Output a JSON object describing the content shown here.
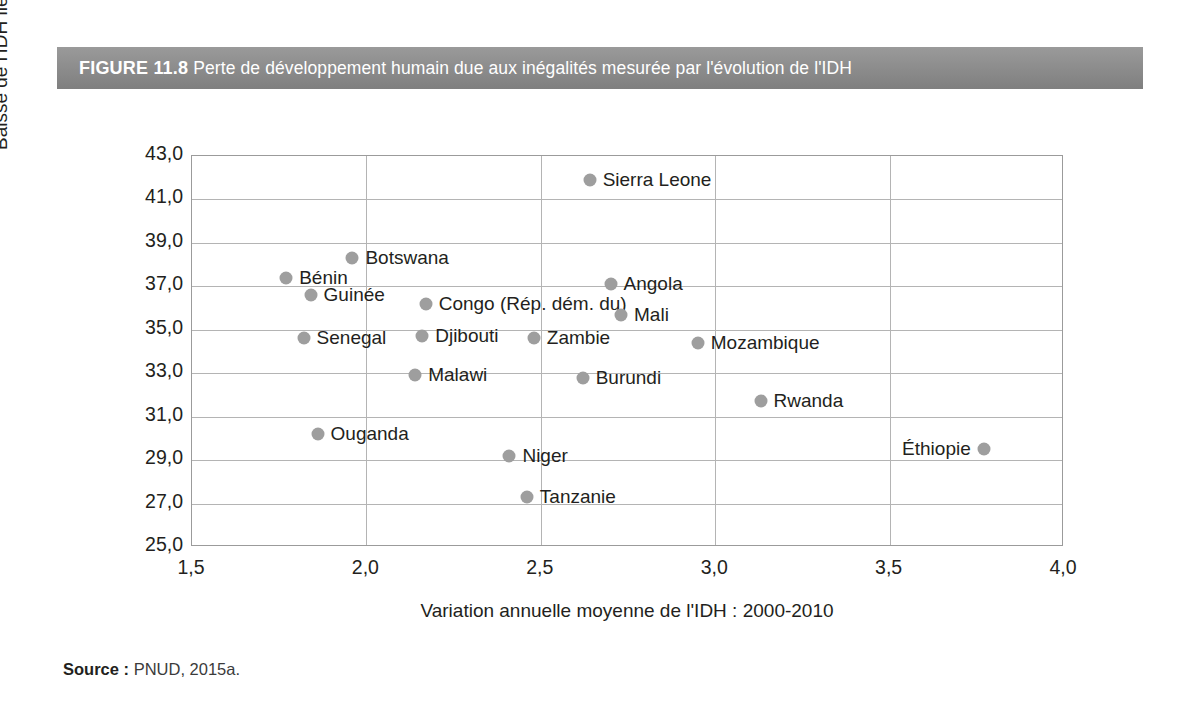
{
  "figure": {
    "number": "FIGURE 11.8",
    "title": "Perte de développement humain due aux inégalités mesurée par l'évolution de l'IDH",
    "header_bg": "#8e8e8e",
    "header_text_color": "#ffffff"
  },
  "source": {
    "label": "Source :",
    "value": "PNUD, 2015a."
  },
  "chart_data": {
    "type": "scatter",
    "title": "Perte de développement humain due aux inégalités mesurée par l'évolution de l'IDH",
    "xlabel": "Variation annuelle moyenne de l'IDH : 2000-2010",
    "ylabel": "Baisse de l'IDH liée aux inégalités (%)",
    "xlim": [
      1.5,
      4.0
    ],
    "ylim": [
      25.0,
      43.0
    ],
    "xticks": [
      "1,5",
      "2,0",
      "2,5",
      "3,0",
      "3,5",
      "4,0"
    ],
    "xtick_values": [
      1.5,
      2.0,
      2.5,
      3.0,
      3.5,
      4.0
    ],
    "yticks": [
      "25,0",
      "27,0",
      "29,0",
      "31,0",
      "33,0",
      "35,0",
      "37,0",
      "39,0",
      "41,0",
      "43,0"
    ],
    "ytick_values": [
      25.0,
      27.0,
      29.0,
      31.0,
      33.0,
      35.0,
      37.0,
      39.0,
      41.0,
      43.0
    ],
    "grid": true,
    "legend": "none",
    "marker_color": "#9e9e9e",
    "points": [
      {
        "label": "Sierra Leone",
        "x": 2.64,
        "y": 41.9,
        "label_side": "right"
      },
      {
        "label": "Botswana",
        "x": 1.96,
        "y": 38.3,
        "label_side": "right"
      },
      {
        "label": "Bénin",
        "x": 1.77,
        "y": 37.4,
        "label_side": "right"
      },
      {
        "label": "Angola",
        "x": 2.7,
        "y": 37.1,
        "label_side": "right"
      },
      {
        "label": "Guinée",
        "x": 1.84,
        "y": 36.6,
        "label_side": "right"
      },
      {
        "label": "Congo (Rép. dém. du)",
        "x": 2.17,
        "y": 36.2,
        "label_side": "right"
      },
      {
        "label": "Mali",
        "x": 2.73,
        "y": 35.7,
        "label_side": "right"
      },
      {
        "label": "Senegal",
        "x": 1.82,
        "y": 34.6,
        "label_side": "right"
      },
      {
        "label": "Djibouti",
        "x": 2.16,
        "y": 34.7,
        "label_side": "right"
      },
      {
        "label": "Zambie",
        "x": 2.48,
        "y": 34.6,
        "label_side": "right"
      },
      {
        "label": "Mozambique",
        "x": 2.95,
        "y": 34.4,
        "label_side": "right"
      },
      {
        "label": "Malawi",
        "x": 2.14,
        "y": 32.9,
        "label_side": "right"
      },
      {
        "label": "Burundi",
        "x": 2.62,
        "y": 32.8,
        "label_side": "right"
      },
      {
        "label": "Rwanda",
        "x": 3.13,
        "y": 31.7,
        "label_side": "right"
      },
      {
        "label": "Ouganda",
        "x": 1.86,
        "y": 30.2,
        "label_side": "right"
      },
      {
        "label": "Niger",
        "x": 2.41,
        "y": 29.2,
        "label_side": "right"
      },
      {
        "label": "Éthiopie",
        "x": 3.77,
        "y": 29.5,
        "label_side": "left"
      },
      {
        "label": "Tanzanie",
        "x": 2.46,
        "y": 27.3,
        "label_side": "right"
      }
    ]
  }
}
